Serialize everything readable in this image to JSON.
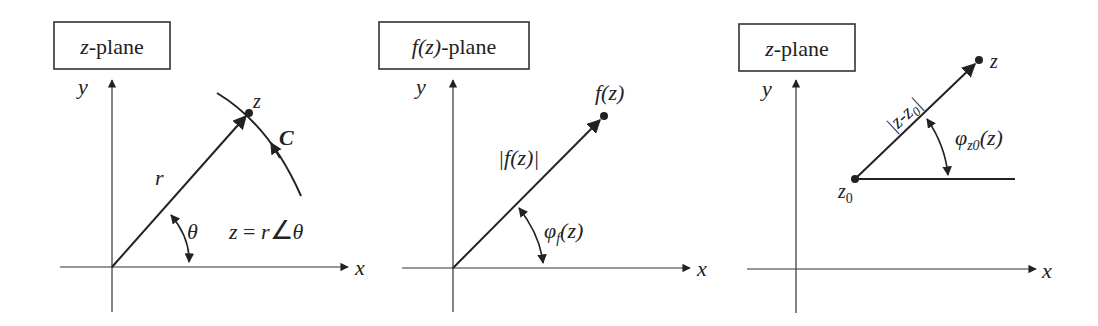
{
  "panels": [
    {
      "title_var": "z",
      "title_suffix": "-plane",
      "axis_x": "x",
      "axis_y": "y",
      "point_label": "z",
      "vector_label": "r",
      "angle_label": "θ",
      "curve_label": "C",
      "equation": {
        "lhs": "z",
        "eq": " = ",
        "r": "r",
        "angle": "∠",
        "theta": "θ"
      }
    },
    {
      "title_var": "f(z)",
      "title_suffix": "-plane",
      "axis_x": "x",
      "axis_y": "y",
      "point_label": "f(z)",
      "vector_label": "|f(z)|",
      "angle_label": "φ",
      "angle_sub": "f",
      "angle_arg": "(z)"
    },
    {
      "title_var": "z",
      "title_suffix": "-plane",
      "axis_x": "x",
      "axis_y": "y",
      "point_label": "z",
      "origin_label": "z",
      "origin_sub": "0",
      "vector_label": "|z-z",
      "vector_sub": "0",
      "vector_close": "|",
      "angle_label": "φ",
      "angle_sub": "z0",
      "angle_arg": "(z)"
    }
  ],
  "colors": {
    "ink": "#222222",
    "background": "#ffffff"
  }
}
